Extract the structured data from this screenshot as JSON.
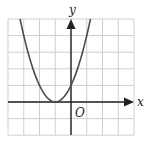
{
  "chart_data": {
    "type": "line",
    "title": "",
    "function": "y = (x + 1)^2",
    "xlabel": "x",
    "ylabel": "y",
    "origin_label": "O",
    "xlim": [
      -4,
      4
    ],
    "ylim": [
      -2,
      5
    ],
    "grid": true,
    "grid_step": 1,
    "series": [
      {
        "name": "parabola",
        "x": [
          -3.24,
          -3,
          -2.5,
          -2,
          -1.5,
          -1,
          -0.5,
          0,
          0.5,
          1,
          1.24
        ],
        "values": [
          5,
          4,
          2.25,
          1,
          0.25,
          0,
          0.25,
          1,
          2.25,
          4,
          5
        ]
      }
    ],
    "vertex": [
      -1,
      0
    ],
    "y_intercept": [
      0,
      1
    ]
  },
  "colors": {
    "grid": "#cfcfcf",
    "axis": "#222222",
    "curve": "#4a4a4a"
  }
}
